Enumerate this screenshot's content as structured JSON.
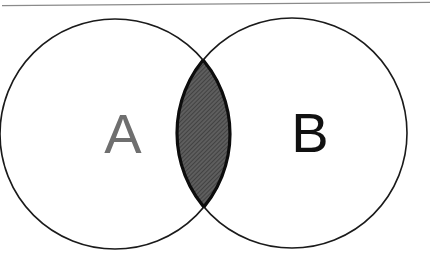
{
  "figure": {
    "type": "venn-diagram",
    "title": "",
    "background_color": "#ffffff",
    "scan_artifact": {
      "name": "top-border-line",
      "color": "#8a8a8a",
      "left_y": 5.5,
      "right_y": 2.5,
      "thickness": 1.4
    }
  },
  "sets": [
    {
      "id": "A",
      "label": "A",
      "label_color": "#6f6f6f",
      "label_x": 123,
      "label_y": 133,
      "label_size": 56,
      "center_x": 115,
      "center_y": 134,
      "radius": 115,
      "fill": "#ffffff",
      "stroke": "#1a1a1a",
      "stroke_width": 1.6
    },
    {
      "id": "B",
      "label": "B",
      "label_color": "#111111",
      "label_x": 310,
      "label_y": 132,
      "label_size": 56,
      "center_x": 292,
      "center_y": 133,
      "radius": 115,
      "fill": "#ffffff",
      "stroke": "#1a1a1a",
      "stroke_width": 1.6
    }
  ],
  "intersection": {
    "id": "A-and-B",
    "label": "",
    "fill_base": "#5e5e5e",
    "hatch_color": "#3a3a3a",
    "hatch_angle_deg": 45,
    "hatch_spacing": 3,
    "stroke": "#0d0d0d",
    "stroke_width": 3,
    "top_x": 217,
    "top_y": 66,
    "bottom_x": 217,
    "bottom_y": 198,
    "left_x": 193,
    "right_x": 241
  }
}
